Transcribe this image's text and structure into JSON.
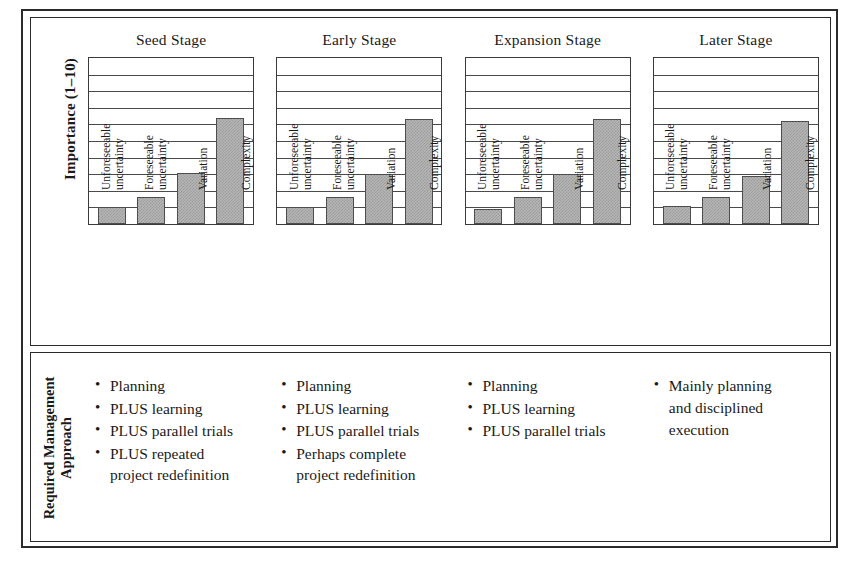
{
  "chart_data": {
    "type": "bar",
    "title": "",
    "ylabel": "Importance (1–10)",
    "xlabel": "",
    "ylim": [
      0,
      10
    ],
    "grid": true,
    "gridline_count": 9,
    "legend": "none",
    "categories": [
      "Unforeseeable uncertainty",
      "Foreseeable uncertainty",
      "Variation",
      "Complexity"
    ],
    "panels": [
      {
        "title": "Seed Stage",
        "values": [
          1.0,
          1.6,
          3.1,
          6.4
        ]
      },
      {
        "title": "Early Stage",
        "values": [
          1.0,
          1.6,
          3.0,
          6.3
        ]
      },
      {
        "title": "Expansion Stage",
        "values": [
          0.9,
          1.6,
          3.0,
          6.3
        ]
      },
      {
        "title": "Later Stage",
        "values": [
          1.1,
          1.6,
          2.9,
          6.2
        ]
      }
    ]
  },
  "axis": {
    "y_title": "Importance (1–10)",
    "categories": [
      {
        "lines": [
          "Unforeseeable",
          "uncertainty"
        ]
      },
      {
        "lines": [
          "Foreseeable",
          "uncertainty"
        ]
      },
      {
        "lines": [
          "Variation"
        ]
      },
      {
        "lines": [
          "Complexity"
        ]
      }
    ]
  },
  "approach": {
    "row_label_lines": [
      "Required Management",
      "Approach"
    ],
    "columns": [
      {
        "stage": "Seed Stage",
        "bullets": [
          {
            "text": "Planning",
            "continuation": ""
          },
          {
            "text": "PLUS learning",
            "continuation": ""
          },
          {
            "text": "PLUS parallel trials",
            "continuation": ""
          },
          {
            "text": "PLUS repeated",
            "continuation": "project redefinition"
          }
        ]
      },
      {
        "stage": "Early Stage",
        "bullets": [
          {
            "text": "Planning",
            "continuation": ""
          },
          {
            "text": "PLUS learning",
            "continuation": ""
          },
          {
            "text": "PLUS parallel trials",
            "continuation": ""
          },
          {
            "text": "Perhaps complete",
            "continuation": "project redefinition"
          }
        ]
      },
      {
        "stage": "Expansion Stage",
        "bullets": [
          {
            "text": "Planning",
            "continuation": ""
          },
          {
            "text": "PLUS learning",
            "continuation": ""
          },
          {
            "text": "PLUS parallel trials",
            "continuation": ""
          }
        ]
      },
      {
        "stage": "Later Stage",
        "bullets": [
          {
            "text": "Mainly planning",
            "continuation": "and disciplined"
          },
          {
            "text": "",
            "continuation": "execution"
          }
        ]
      }
    ]
  },
  "style": {
    "bar_fill": "#b5b5b5",
    "bar_border": "#4d4d4d",
    "grid_color": "#4a4a4a",
    "frame_color": "#2b2b2b",
    "text_color": "#1a1a1a"
  }
}
